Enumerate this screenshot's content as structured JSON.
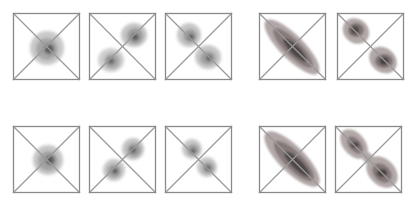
{
  "figure": {
    "colors": {
      "frame": "#8a8a8a",
      "diag": "#9a9a9a",
      "left_group_light": "#c8c8c8",
      "left_group_mid": "#9e9e9e",
      "left_group_dark": "#5a5a5a",
      "right_group_light": "#b4a9a9",
      "right_group_mid": "#8c7f7f",
      "right_group_dark": "#4e4646"
    },
    "rows": [
      {
        "name": "top-row",
        "panels": [
          {
            "id": "panel-1-1",
            "x": 13,
            "y": 13,
            "shape": "single-blob-center"
          },
          {
            "id": "panel-1-2",
            "x": 89,
            "y": 13,
            "shape": "two-blobs-anti-diagonal"
          },
          {
            "id": "panel-1-3",
            "x": 165,
            "y": 13,
            "shape": "two-blobs-main-diagonal"
          },
          {
            "id": "panel-1-4",
            "x": 259,
            "y": 13,
            "shape": "elongated-ellipse-main-diagonal"
          },
          {
            "id": "panel-1-5",
            "x": 337,
            "y": 13,
            "shape": "two-separated-lobes-main-diagonal"
          }
        ]
      },
      {
        "name": "bottom-row",
        "panels": [
          {
            "id": "panel-2-1",
            "x": 13,
            "y": 126,
            "shape": "single-blob-center"
          },
          {
            "id": "panel-2-2",
            "x": 89,
            "y": 126,
            "shape": "two-blobs-anti-diagonal"
          },
          {
            "id": "panel-2-3",
            "x": 165,
            "y": 126,
            "shape": "two-blobs-main-diagonal"
          },
          {
            "id": "panel-2-4",
            "x": 259,
            "y": 126,
            "shape": "elongated-ellipse-main-diagonal"
          },
          {
            "id": "panel-2-5",
            "x": 335,
            "y": 126,
            "shape": "two-joined-lobes-main-diagonal"
          }
        ]
      }
    ]
  }
}
